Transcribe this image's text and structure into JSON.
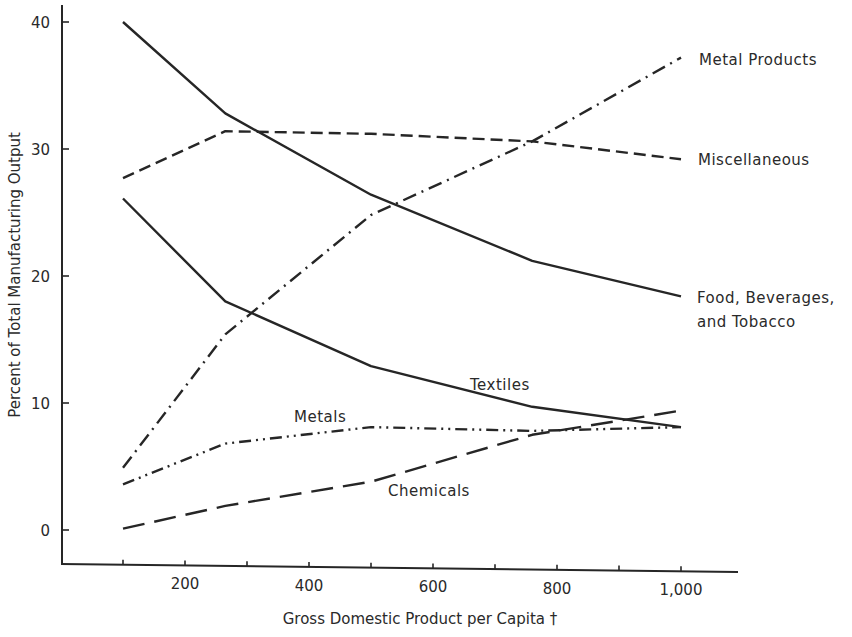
{
  "chart_data": {
    "type": "line",
    "title": "",
    "xlabel": "Gross Domestic Product per Capita †",
    "ylabel": "Percent of Total Manufacturing Output",
    "x": [
      100,
      265,
      500,
      760,
      1000
    ],
    "xlim": [
      0,
      1100
    ],
    "ylim": [
      -3,
      41
    ],
    "x_ticks": [
      100,
      200,
      300,
      400,
      500,
      600,
      700,
      800,
      900,
      1000
    ],
    "x_tick_labels": [
      {
        "value": 200,
        "label": "200"
      },
      {
        "value": 400,
        "label": "400"
      },
      {
        "value": 600,
        "label": "600"
      },
      {
        "value": 800,
        "label": "800"
      },
      {
        "value": 1000,
        "label": "1,000"
      }
    ],
    "y_ticks": [
      {
        "value": 0,
        "label": "0"
      },
      {
        "value": 10,
        "label": "10"
      },
      {
        "value": 20,
        "label": "20"
      },
      {
        "value": 30,
        "label": "30"
      },
      {
        "value": 40,
        "label": "40"
      }
    ],
    "grid": false,
    "legend": "inline labels",
    "series": [
      {
        "name": "Food, Beverages, and Tobacco",
        "label_lines": [
          "Food, Beverages,",
          "and Tobacco"
        ],
        "style": "solid",
        "values": [
          40.0,
          32.8,
          26.4,
          21.2,
          18.4
        ]
      },
      {
        "name": "Miscellaneous",
        "label_lines": [
          "Miscellaneous"
        ],
        "style": "dashed",
        "values": [
          27.7,
          31.4,
          31.2,
          30.6,
          29.2
        ]
      },
      {
        "name": "Metal Products",
        "label_lines": [
          "Metal Products"
        ],
        "style": "dash-dot",
        "values": [
          4.9,
          15.4,
          24.8,
          30.6,
          37.2
        ]
      },
      {
        "name": "Textiles",
        "label_lines": [
          "Textiles"
        ],
        "style": "solid",
        "values": [
          26.1,
          18.0,
          12.9,
          9.7,
          8.1
        ]
      },
      {
        "name": "Metals",
        "label_lines": [
          "Metals"
        ],
        "style": "dash-dot-dot",
        "values": [
          3.6,
          6.8,
          8.1,
          7.8,
          8.1
        ]
      },
      {
        "name": "Chemicals",
        "label_lines": [
          "Chemicals"
        ],
        "style": "long-dash",
        "values": [
          0.1,
          1.9,
          3.8,
          7.5,
          9.4
        ]
      }
    ]
  }
}
